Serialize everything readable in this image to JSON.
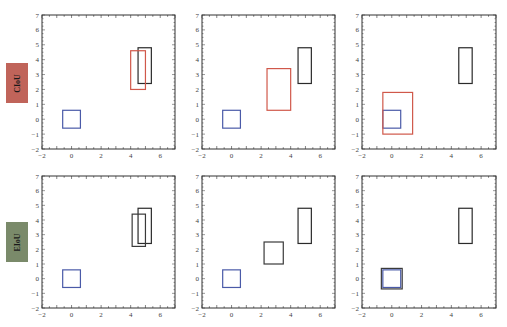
{
  "rows": [
    {
      "label": "CIoU",
      "label_color": "#c0645a"
    },
    {
      "label": "EIoU",
      "label_color": "#7a8a6a"
    }
  ],
  "axes": {
    "xlim": [
      -2,
      7
    ],
    "ylim": [
      -2,
      7
    ],
    "xticks": [
      -2,
      0,
      2,
      4,
      6
    ],
    "yticks": [
      -2,
      -1,
      0,
      1,
      2,
      3,
      4,
      5,
      6,
      7
    ]
  },
  "colors": {
    "anchor": "#4a5aa8",
    "target": "#2a2a2a",
    "ciou_pred": "#d0584a",
    "eiou_pred": "#3a3a3a",
    "frame": "#333333"
  },
  "chart_data": [
    {
      "type": "box-diagram",
      "row": "CIoU",
      "col": 1,
      "xlim": [
        -2,
        7
      ],
      "ylim": [
        -2,
        7
      ],
      "boxes": [
        {
          "role": "anchor",
          "x": [
            -0.6,
            0.6
          ],
          "y": [
            -0.6,
            0.6
          ]
        },
        {
          "role": "target",
          "x": [
            4.5,
            5.4
          ],
          "y": [
            2.4,
            4.8
          ]
        },
        {
          "role": "prediction",
          "x": [
            4.0,
            5.0
          ],
          "y": [
            2.0,
            4.6
          ]
        }
      ]
    },
    {
      "type": "box-diagram",
      "row": "CIoU",
      "col": 2,
      "xlim": [
        -2,
        7
      ],
      "ylim": [
        -2,
        7
      ],
      "boxes": [
        {
          "role": "anchor",
          "x": [
            -0.6,
            0.6
          ],
          "y": [
            -0.6,
            0.6
          ]
        },
        {
          "role": "target",
          "x": [
            4.5,
            5.4
          ],
          "y": [
            2.4,
            4.8
          ]
        },
        {
          "role": "prediction",
          "x": [
            2.4,
            4.0
          ],
          "y": [
            0.6,
            3.4
          ]
        }
      ]
    },
    {
      "type": "box-diagram",
      "row": "CIoU",
      "col": 3,
      "xlim": [
        -2,
        7
      ],
      "ylim": [
        -2,
        7
      ],
      "boxes": [
        {
          "role": "anchor",
          "x": [
            -0.6,
            0.6
          ],
          "y": [
            -0.6,
            0.6
          ]
        },
        {
          "role": "target",
          "x": [
            4.5,
            5.4
          ],
          "y": [
            2.4,
            4.8
          ]
        },
        {
          "role": "prediction",
          "x": [
            -0.6,
            1.4
          ],
          "y": [
            -1.0,
            1.8
          ]
        }
      ]
    },
    {
      "type": "box-diagram",
      "row": "EIoU",
      "col": 1,
      "xlim": [
        -2,
        7
      ],
      "ylim": [
        -2,
        7
      ],
      "boxes": [
        {
          "role": "anchor",
          "x": [
            -0.6,
            0.6
          ],
          "y": [
            -0.6,
            0.6
          ]
        },
        {
          "role": "target",
          "x": [
            4.5,
            5.4
          ],
          "y": [
            2.4,
            4.8
          ]
        },
        {
          "role": "prediction",
          "x": [
            4.1,
            5.0
          ],
          "y": [
            2.2,
            4.4
          ]
        }
      ]
    },
    {
      "type": "box-diagram",
      "row": "EIoU",
      "col": 2,
      "xlim": [
        -2,
        7
      ],
      "ylim": [
        -2,
        7
      ],
      "boxes": [
        {
          "role": "anchor",
          "x": [
            -0.6,
            0.6
          ],
          "y": [
            -0.6,
            0.6
          ]
        },
        {
          "role": "target",
          "x": [
            4.5,
            5.4
          ],
          "y": [
            2.4,
            4.8
          ]
        },
        {
          "role": "prediction",
          "x": [
            2.2,
            3.5
          ],
          "y": [
            1.0,
            2.5
          ]
        }
      ]
    },
    {
      "type": "box-diagram",
      "row": "EIoU",
      "col": 3,
      "xlim": [
        -2,
        7
      ],
      "ylim": [
        -2,
        7
      ],
      "boxes": [
        {
          "role": "anchor",
          "x": [
            -0.6,
            0.6
          ],
          "y": [
            -0.6,
            0.6
          ]
        },
        {
          "role": "target",
          "x": [
            4.5,
            5.4
          ],
          "y": [
            2.4,
            4.8
          ]
        },
        {
          "role": "prediction",
          "x": [
            -0.7,
            0.7
          ],
          "y": [
            -0.7,
            0.7
          ]
        }
      ]
    }
  ]
}
